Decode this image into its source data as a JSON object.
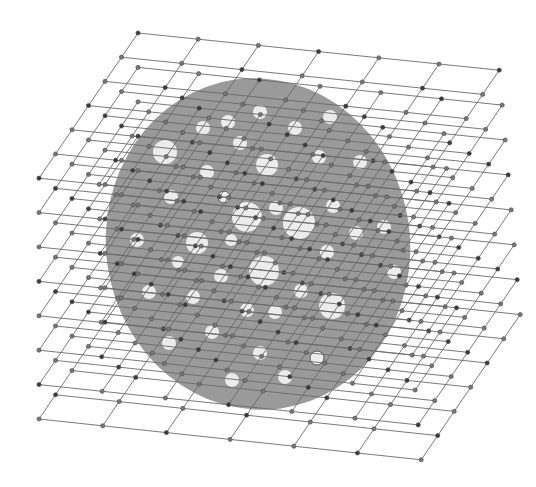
{
  "figure": {
    "width": 536,
    "height": 487,
    "background": "#ffffff",
    "disk": {
      "cx": 258,
      "cy": 244,
      "rx": 152,
      "ry": 166,
      "rotate": -8,
      "color": "#9a9a9a"
    },
    "hole_color": "#ececec",
    "holes": [
      {
        "cx": 165,
        "cy": 152,
        "r": 12
      },
      {
        "cx": 203,
        "cy": 128,
        "r": 7
      },
      {
        "cx": 228,
        "cy": 122,
        "r": 7
      },
      {
        "cx": 260,
        "cy": 112,
        "r": 7
      },
      {
        "cx": 295,
        "cy": 128,
        "r": 7
      },
      {
        "cx": 330,
        "cy": 117,
        "r": 7
      },
      {
        "cx": 240,
        "cy": 143,
        "r": 7
      },
      {
        "cx": 267,
        "cy": 165,
        "r": 11
      },
      {
        "cx": 319,
        "cy": 157,
        "r": 7
      },
      {
        "cx": 360,
        "cy": 162,
        "r": 7
      },
      {
        "cx": 207,
        "cy": 172,
        "r": 7
      },
      {
        "cx": 171,
        "cy": 197,
        "r": 7
      },
      {
        "cx": 224,
        "cy": 197,
        "r": 6,
        "ring": true
      },
      {
        "cx": 247,
        "cy": 217,
        "r": 15
      },
      {
        "cx": 276,
        "cy": 208,
        "r": 7
      },
      {
        "cx": 299,
        "cy": 223,
        "r": 16
      },
      {
        "cx": 333,
        "cy": 206,
        "r": 7
      },
      {
        "cx": 384,
        "cy": 227,
        "r": 7
      },
      {
        "cx": 356,
        "cy": 233,
        "r": 7
      },
      {
        "cx": 137,
        "cy": 240,
        "r": 7
      },
      {
        "cx": 197,
        "cy": 243,
        "r": 11
      },
      {
        "cx": 231,
        "cy": 240,
        "r": 6
      },
      {
        "cx": 327,
        "cy": 252,
        "r": 7
      },
      {
        "cx": 264,
        "cy": 271,
        "r": 15
      },
      {
        "cx": 394,
        "cy": 272,
        "r": 7
      },
      {
        "cx": 221,
        "cy": 276,
        "r": 7
      },
      {
        "cx": 178,
        "cy": 262,
        "r": 6
      },
      {
        "cx": 149,
        "cy": 292,
        "r": 7
      },
      {
        "cx": 193,
        "cy": 297,
        "r": 7
      },
      {
        "cx": 301,
        "cy": 291,
        "r": 7
      },
      {
        "cx": 247,
        "cy": 310,
        "r": 7
      },
      {
        "cx": 275,
        "cy": 312,
        "r": 7
      },
      {
        "cx": 332,
        "cy": 306,
        "r": 13
      },
      {
        "cx": 212,
        "cy": 332,
        "r": 7
      },
      {
        "cx": 169,
        "cy": 343,
        "r": 7
      },
      {
        "cx": 260,
        "cy": 353,
        "r": 7
      },
      {
        "cx": 317,
        "cy": 358,
        "r": 7,
        "ring": true
      },
      {
        "cx": 232,
        "cy": 380,
        "r": 7
      },
      {
        "cx": 285,
        "cy": 377,
        "r": 7
      }
    ],
    "lattices": {
      "count": 8,
      "rows": 7,
      "cols": 7,
      "first_top_left": [
        138,
        33
      ],
      "vertical_offset": 34.4,
      "row_step_first": [
        60.2,
        6.2
      ],
      "row_step_last": [
        63.7,
        6.8
      ],
      "col_step": [
        -16.5,
        24.2
      ],
      "line_color": "#6a6a6a",
      "node_color": "#777777",
      "node_dark_color": "#3a3a3a",
      "node_radius": 2.1
    }
  }
}
